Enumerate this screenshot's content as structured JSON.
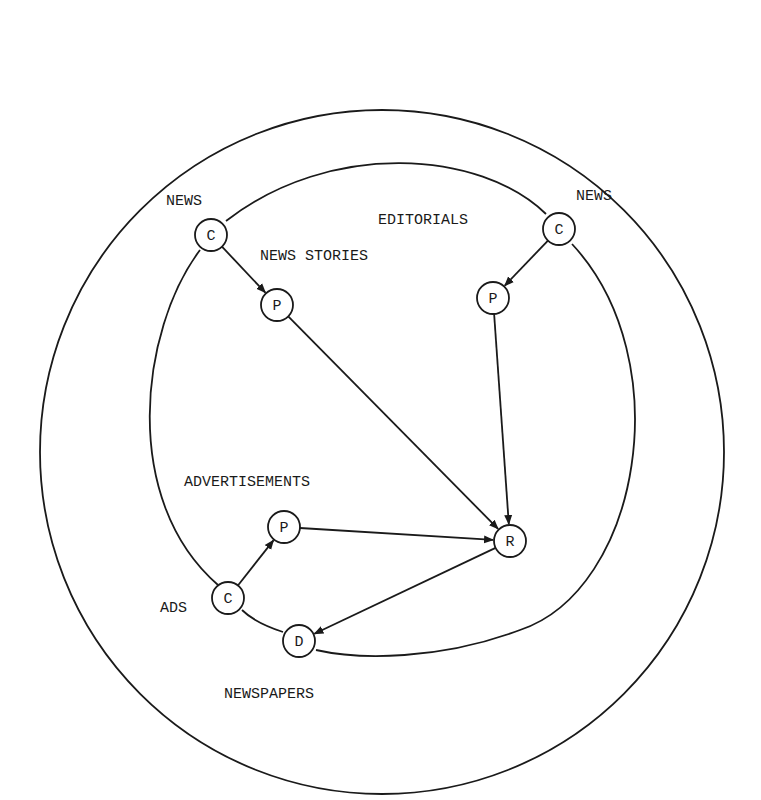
{
  "diagram": {
    "outer_circle": {
      "cx": 382,
      "cy": 452,
      "r": 342
    },
    "inner_loop_label": "NEWSPAPERS",
    "labels": [
      {
        "id": "news-left",
        "text": "NEWS",
        "x": 166,
        "y": 205
      },
      {
        "id": "news-stories",
        "text": "NEWS STORIES",
        "x": 260,
        "y": 260
      },
      {
        "id": "editorials",
        "text": "EDITORIALS",
        "x": 378,
        "y": 224
      },
      {
        "id": "news-right",
        "text": "NEWS",
        "x": 576,
        "y": 200
      },
      {
        "id": "advertisements",
        "text": "ADVERTISEMENTS",
        "x": 184,
        "y": 486
      },
      {
        "id": "ads",
        "text": "ADS",
        "x": 160,
        "y": 612
      },
      {
        "id": "newspapers",
        "text": "NEWSPAPERS",
        "x": 224,
        "y": 698
      }
    ],
    "nodes": [
      {
        "id": "c-news-left",
        "text": "C",
        "cx": 211,
        "cy": 235
      },
      {
        "id": "p-news-stories",
        "text": "P",
        "cx": 277,
        "cy": 305
      },
      {
        "id": "c-news-right",
        "text": "C",
        "cx": 559,
        "cy": 229
      },
      {
        "id": "p-editorials",
        "text": "P",
        "cx": 493,
        "cy": 298
      },
      {
        "id": "p-ads",
        "text": "P",
        "cx": 284,
        "cy": 527
      },
      {
        "id": "c-ads",
        "text": "C",
        "cx": 228,
        "cy": 598
      },
      {
        "id": "r-center",
        "text": "R",
        "cx": 510,
        "cy": 541
      },
      {
        "id": "d-newspapers",
        "text": "D",
        "cx": 299,
        "cy": 641
      }
    ],
    "edges": [
      {
        "from": "c-news-left",
        "to": "p-news-stories"
      },
      {
        "from": "c-news-right",
        "to": "p-editorials"
      },
      {
        "from": "p-news-stories",
        "to": "r-center"
      },
      {
        "from": "p-editorials",
        "to": "r-center"
      },
      {
        "from": "c-ads",
        "to": "p-ads"
      },
      {
        "from": "p-ads",
        "to": "r-center"
      },
      {
        "from": "r-center",
        "to": "d-newspapers"
      }
    ]
  }
}
